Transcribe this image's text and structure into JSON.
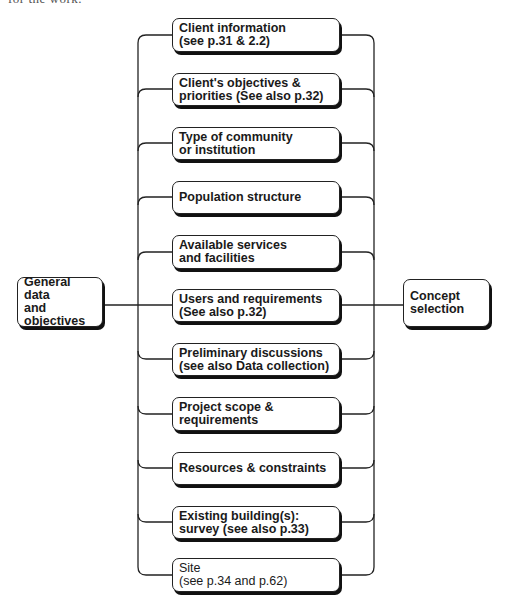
{
  "caption": "for the work.",
  "source": {
    "label": "General data\nand\nobjectives"
  },
  "target": {
    "label": "Concept\nselection"
  },
  "items": [
    {
      "label": "Client information\n(see p.31 & 2.2)",
      "top": 18
    },
    {
      "label": "Client's objectives &\npriorities (See also p.32)",
      "top": 73
    },
    {
      "label": "Type of community\nor institution",
      "top": 127
    },
    {
      "label": "Population structure",
      "top": 181
    },
    {
      "label": "Available services\nand facilities",
      "top": 235
    },
    {
      "label": "Users and requirements\n(See also p.32)",
      "top": 289
    },
    {
      "label": "Preliminary discussions\n(see also Data collection)",
      "top": 343
    },
    {
      "label": "Project scope &\nrequirements",
      "top": 397
    },
    {
      "label": "Resources & constraints",
      "top": 452
    },
    {
      "label": "Existing building(s):\nsurvey (see also p.33)",
      "top": 506
    },
    {
      "label": "Site\n(see p.34 and p.62)",
      "top": 558
    }
  ],
  "colors": {
    "line": "#222222",
    "shadow": "#111111",
    "background": "#ffffff"
  }
}
